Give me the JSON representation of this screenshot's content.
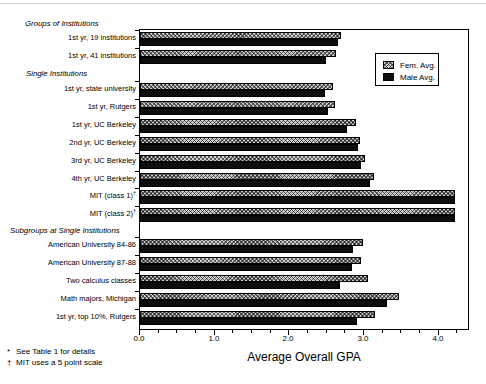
{
  "chart_data": {
    "type": "bar",
    "orientation": "horizontal",
    "xlabel": "Average Overall GPA",
    "xlim": [
      0.0,
      4.42
    ],
    "x_ticks": [
      "0.0",
      "1.0",
      "2.0",
      "3.0",
      "4.0"
    ],
    "minor_tick_step": 0.25,
    "grid": false,
    "legend_position": "upper-right-inside",
    "legend": [
      {
        "label": "Fem. Avg.",
        "style": "hatched-gray"
      },
      {
        "label": "Male Avg.",
        "style": "solid-black"
      }
    ],
    "groups": [
      {
        "header": "Groups of Institutions",
        "rows": [
          {
            "label": "1st yr, 19 institutions",
            "fem": 2.69,
            "male": 2.65
          },
          {
            "label": "1st yr, 41 institutions",
            "fem": 2.63,
            "male": 2.49
          }
        ]
      },
      {
        "header": "Single Institutions",
        "rows": [
          {
            "label": "1st yr, state university",
            "fem": 2.59,
            "male": 2.48
          },
          {
            "label": "1st yr, Rutgers",
            "fem": 2.61,
            "male": 2.52
          },
          {
            "label": "1st yr, UC Berkeley",
            "fem": 2.89,
            "male": 2.77
          },
          {
            "label": "2nd yr, UC Berkeley",
            "fem": 2.95,
            "male": 2.92
          },
          {
            "label": "3rd yr, UC Berkeley",
            "fem": 3.01,
            "male": 2.96
          },
          {
            "label": "4th yr, UC Berkeley",
            "fem": 3.13,
            "male": 3.08
          },
          {
            "label": "MIT (class 1)",
            "sup": "†",
            "fem": 4.22,
            "male": 4.22
          },
          {
            "label": "MIT (class 2)",
            "sup": "†",
            "fem": 4.22,
            "male": 4.22
          }
        ]
      },
      {
        "header": "Subgroups at Single Institutions",
        "rows": [
          {
            "label": "American University 84-86",
            "fem": 2.99,
            "male": 2.85
          },
          {
            "label": "American University 87-88",
            "fem": 2.96,
            "male": 2.84
          },
          {
            "label": "Two calculus classes",
            "fem": 3.05,
            "male": 2.68
          },
          {
            "label": "Math majors, Michigan",
            "fem": 3.47,
            "male": 3.31
          },
          {
            "label": "1st yr, top 10%, Rutgers",
            "fem": 3.15,
            "male": 2.91
          }
        ]
      }
    ]
  },
  "footnotes": [
    {
      "marker": "*",
      "text": "See Table 1 for details"
    },
    {
      "marker": "†",
      "text": "MIT uses a 5 point scale"
    }
  ],
  "colors": {
    "frame": "#000000",
    "male_bar": "#0d0d0d",
    "fem_bar_base": "#cdcdcd",
    "fem_bar_hatch": "#000000",
    "background": "#ffffff"
  }
}
